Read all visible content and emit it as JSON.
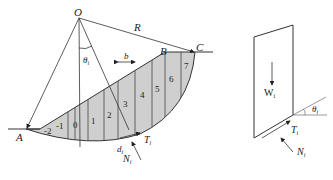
{
  "figure": {
    "left_panel": {
      "title": "slope-slices",
      "points": {
        "O": "O",
        "R": "R",
        "B": "B",
        "C": "C",
        "A": "A"
      },
      "theta": "θ",
      "theta_sub": "i",
      "b": "b",
      "d": "d",
      "d_sub": "i",
      "T": "T",
      "T_sub": "i",
      "N": "N",
      "N_sub": "i",
      "slices": [
        "-2",
        "-1",
        "0",
        "1",
        "2",
        "3",
        "4",
        "5",
        "6",
        "7"
      ]
    },
    "right_panel": {
      "title": "slice-free-body",
      "W": "W",
      "W_sub": "i",
      "theta": "θ",
      "theta_sub": "i",
      "T": "T",
      "T_sub": "i",
      "N": "N",
      "N_sub": "i"
    },
    "colors": {
      "fill": "#c8c8c8",
      "stroke": "#333333"
    }
  }
}
